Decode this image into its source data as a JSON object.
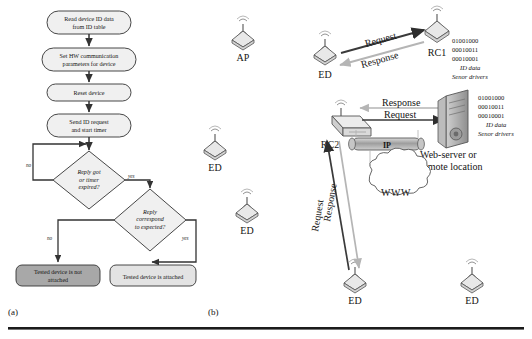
{
  "figure": {
    "captions": [
      {
        "id": "cap-a",
        "text": "(a)"
      },
      {
        "id": "cap-b",
        "text": "(b)"
      }
    ]
  },
  "flowchart": {
    "title_panel": "a",
    "process_steps": [
      {
        "id": "step-read-id",
        "text_line1": "Read device ID data",
        "text_line2": "from ID table"
      },
      {
        "id": "step-set-hw",
        "text_line1": "Set HW communication",
        "text_line2": "parameters for device"
      },
      {
        "id": "step-reset",
        "text_line1": "Reset device",
        "text_line2": ""
      },
      {
        "id": "step-send-request",
        "text_line1": "Send ID request",
        "text_line2": "and start timer"
      }
    ],
    "decisions": [
      {
        "id": "decision-reply-timer",
        "line1": "Reply got",
        "line2": "or timer",
        "line3": "expired?",
        "no_label": "no",
        "yes_label": "yes"
      },
      {
        "id": "decision-reply-expected",
        "line1": "Reply",
        "line2": "correspond",
        "line3": "to expected?",
        "no_label": "no",
        "yes_label": "yes"
      }
    ],
    "terminals": [
      {
        "id": "terminal-not-attached",
        "line1": "Tested device is not",
        "line2": "attached",
        "fill": "#a8a8a8"
      },
      {
        "id": "terminal-attached",
        "line1": "Tested device is attached",
        "line2": "",
        "fill": "#e3e3e3"
      }
    ]
  },
  "network": {
    "nodes": [
      {
        "id": "node-ap",
        "label": "AP",
        "x": 243,
        "y": 40
      },
      {
        "id": "node-ed-left-top",
        "label": "ED",
        "x": 215,
        "y": 150
      },
      {
        "id": "node-ed-mid",
        "label": "ED",
        "x": 247,
        "y": 213
      },
      {
        "id": "node-ed-rc1",
        "label": "ED",
        "x": 325,
        "y": 55
      },
      {
        "id": "node-ed-bottom",
        "label": "ED",
        "x": 355,
        "y": 283
      },
      {
        "id": "node-ed-right",
        "label": "ED",
        "x": 472,
        "y": 283
      },
      {
        "id": "node-rc1",
        "label": "RC1",
        "x": 437,
        "y": 42
      },
      {
        "id": "node-rc2",
        "label": "RC2",
        "x": 330,
        "y": 130
      }
    ],
    "arrows": [
      {
        "id": "arrow-request-rc1",
        "label": "Request",
        "style": "dark"
      },
      {
        "id": "arrow-response-rc1",
        "label": "Response",
        "style": "light"
      },
      {
        "id": "arrow-response-server",
        "label": "Response",
        "style": "light"
      },
      {
        "id": "arrow-request-server",
        "label": "Request",
        "style": "dark"
      },
      {
        "id": "arrow-response-ed",
        "label": "Response",
        "style": "light"
      },
      {
        "id": "arrow-request-ed",
        "label": "Request",
        "style": "dark"
      }
    ],
    "data_blocks": [
      {
        "id": "data-block-rc1",
        "bin1": "01001000",
        "bin2": "00010011",
        "bin3": "00010001",
        "line_id": "ID data",
        "line_drv": "Senor drivers"
      },
      {
        "id": "data-block-server",
        "bin1": "01001000",
        "bin2": "00010011",
        "bin3": "00010001",
        "line_id": "ID data",
        "line_drv": "Senor drivers"
      }
    ],
    "ip_pipe": {
      "label": "IP"
    },
    "cloud": {
      "label": "WWW"
    },
    "server": {
      "line1": "Web-server or",
      "line2": "remote location"
    }
  },
  "colors": {
    "stroke": "#333333",
    "light_arrow": "#b5b5b5",
    "dark_arrow": "#3a3a3a",
    "box_fill": "#f0f0f0",
    "terminal_dark": "#a8a8a8",
    "terminal_light": "#e3e3e3",
    "node_fill": "#e8e8e8",
    "rule": "#1b1b1b"
  }
}
